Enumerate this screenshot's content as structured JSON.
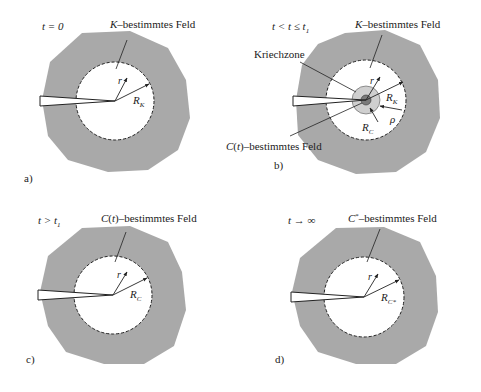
{
  "figure": {
    "colors": {
      "region_fill": "#a9a9a9",
      "inner_fill": "#ffffff",
      "creep_zone_outer": "#cfcfcf",
      "creep_zone_core": "#7a7a7a",
      "line": "#222222"
    },
    "panels": [
      {
        "id": "a",
        "panel_label": "a)",
        "time_condition": "t = 0",
        "field_label": "K–bestimmtes Feld",
        "radius_var": "r",
        "radius_label": "R",
        "radius_sub": "K"
      },
      {
        "id": "b",
        "panel_label": "b)",
        "time_condition": "t < t ≤ t",
        "time_condition_sub": "1",
        "field_label": "K–bestimmtes Feld",
        "creep_zone_label": "Kriechzone",
        "inner_field_label": "C(t)–bestimmtes Feld",
        "radius_var": "r",
        "radius_label": "R",
        "radius_sub": "K",
        "inner_radius_label": "R",
        "inner_radius_sub": "C",
        "rho_label": "ρ"
      },
      {
        "id": "c",
        "panel_label": "c)",
        "time_condition": "t > t",
        "time_condition_sub": "1",
        "field_label": "C(t)–bestimmtes Feld",
        "radius_var": "r",
        "radius_label": "R",
        "radius_sub": "C"
      },
      {
        "id": "d",
        "panel_label": "d)",
        "time_condition": "t → ∞",
        "field_label": "C*–bestimmtes Feld",
        "radius_var": "r",
        "radius_label": "R",
        "radius_sub": "C*"
      }
    ]
  }
}
